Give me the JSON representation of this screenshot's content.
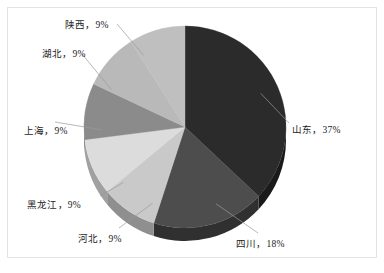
{
  "figure": {
    "border_color": "#e3e3e6",
    "background": "#ffffff"
  },
  "chart_data": {
    "type": "pie",
    "title": "",
    "subtitle": "",
    "xlabel": "",
    "ylabel": "",
    "legend_position": "none",
    "grid": false,
    "label_format": "name, percent",
    "start_angle_deg": 0,
    "direction": "clockwise",
    "three_d": true,
    "categories": [
      "山东",
      "四川",
      "河北",
      "黑龙江",
      "上海",
      "湖北",
      "陕西"
    ],
    "values": [
      37,
      18,
      9,
      9,
      9,
      9,
      9
    ],
    "unit": "%",
    "labels": [
      "山东，37%",
      "四川，18%",
      "河北，9%",
      "黑龙江，9%",
      "上海，9%",
      "湖北，9%",
      "陕西，9%"
    ],
    "colors": [
      "#2b2b2b",
      "#4d4d4d",
      "#c9c9c9",
      "#dcdcdc",
      "#8b8b8b",
      "#b9b9b9",
      "#bfbfbf"
    ],
    "slices": [
      {
        "name": "山东",
        "label": "山东，37%",
        "value": 37,
        "color": "#2b2b2b",
        "side_color": "#1a1a1a"
      },
      {
        "name": "四川",
        "label": "四川，18%",
        "value": 18,
        "color": "#4d4d4d",
        "side_color": "#303030"
      },
      {
        "name": "河北",
        "label": "河北，9%",
        "value": 9,
        "color": "#c9c9c9",
        "side_color": "#8f8f8f"
      },
      {
        "name": "黑龙江",
        "label": "黑龙江，9%",
        "value": 9,
        "color": "#dcdcdc",
        "side_color": "#a0a0a0"
      },
      {
        "name": "上海",
        "label": "上海，9%",
        "value": 9,
        "color": "#8b8b8b",
        "side_color": "#636363"
      },
      {
        "name": "湖北",
        "label": "湖北，9%",
        "value": 9,
        "color": "#b9b9b9",
        "side_color": "#868686"
      },
      {
        "name": "陕西",
        "label": "陕西，9%",
        "value": 9,
        "color": "#bfbfbf",
        "side_color": "#8a8a8a"
      }
    ]
  },
  "caption": {
    "text": ""
  }
}
